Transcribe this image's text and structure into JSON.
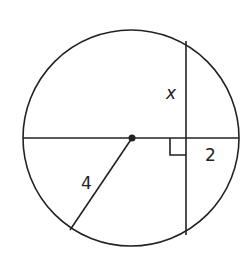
{
  "diagram": {
    "type": "circle-chord-geometry",
    "circle": {
      "cx": 131,
      "cy": 138,
      "r": 108
    },
    "center_point": {
      "x": 132,
      "y": 138
    },
    "diameter": {
      "x1": 23,
      "y1": 138,
      "x2": 239,
      "y2": 138
    },
    "chord": {
      "x1": 186,
      "y1": 41,
      "x2": 186,
      "y2": 235
    },
    "radius_segment": {
      "x1": 132,
      "y1": 138,
      "x2": 70,
      "y2": 230
    },
    "right_angle_marker": {
      "x": 170,
      "y": 138,
      "size": 16
    },
    "labels": {
      "chord_half": "x",
      "segment_outer": "2",
      "radius": "4"
    },
    "colors": {
      "line": "#222222",
      "background": "#ffffff"
    }
  }
}
